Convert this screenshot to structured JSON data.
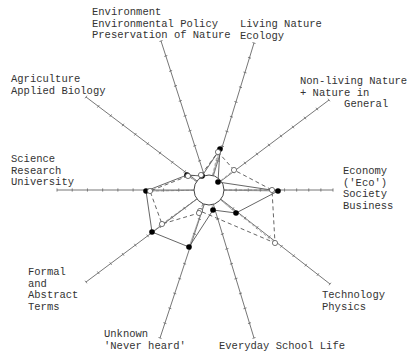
{
  "chart_data": {
    "type": "radar",
    "title": "",
    "center": [
      209,
      190
    ],
    "inner_radius": 15,
    "axes": [
      {
        "id": "environment",
        "label": [
          "Environment",
          "Environmental Policy",
          "Preservation of Nature"
        ],
        "end": [
          161,
          41
        ],
        "ticks": 9
      },
      {
        "id": "living_nature",
        "label": [
          "Living Nature",
          "Ecology"
        ],
        "end": [
          254,
          43
        ],
        "ticks": 9
      },
      {
        "id": "non_living_nature",
        "label": [
          "Non-living Nature",
          "+ Nature in",
          "      General"
        ],
        "end": [
          329,
          100
        ],
        "ticks": 9
      },
      {
        "id": "economy",
        "label": [
          "Economy",
          "('Eco')",
          "Society",
          "Business"
        ],
        "end": [
          333,
          190
        ],
        "ticks": 9
      },
      {
        "id": "technology",
        "label": [
          "Technology",
          "Physics"
        ],
        "end": [
          330,
          284
        ],
        "ticks": 9
      },
      {
        "id": "everyday_school_life",
        "label": [
          "Everyday School Life"
        ],
        "end": [
          254,
          338
        ],
        "ticks": 9
      },
      {
        "id": "unknown",
        "label": [
          "Unknown",
          "'Never heard'"
        ],
        "end": [
          160,
          338
        ],
        "ticks": 9
      },
      {
        "id": "formal_abstract",
        "label": [
          "Formal",
          "and",
          "Abstract",
          "Terms"
        ],
        "end": [
          86,
          282
        ],
        "ticks": 9
      },
      {
        "id": "science_research",
        "label": [
          "Science",
          "Research",
          "University"
        ],
        "end": [
          57,
          190
        ],
        "ticks": 9
      },
      {
        "id": "agriculture",
        "label": [
          "Agriculture",
          "Applied Biology"
        ],
        "end": [
          86,
          97
        ],
        "ticks": 9
      }
    ],
    "series": [
      {
        "name": "Series A (solid line, filled markers)",
        "style": "solid",
        "marker": "filled",
        "points": [
          [
            202,
            176
          ],
          [
            220,
            149
          ],
          [
            218,
            182
          ],
          [
            278,
            191
          ],
          [
            236,
            213
          ],
          [
            213,
            210
          ],
          [
            189,
            247
          ],
          [
            152,
            232
          ],
          [
            146,
            191
          ],
          [
            187,
            175
          ]
        ]
      },
      {
        "name": "Series B (dashed line, open markers)",
        "style": "dashed",
        "marker": "open",
        "points": [
          [
            201,
            175
          ],
          [
            218,
            152
          ],
          [
            234,
            170
          ],
          [
            272,
            190
          ],
          [
            275,
            243
          ],
          [
            200,
            211
          ],
          [
            199,
            213
          ],
          [
            162,
            224
          ],
          [
            150,
            191
          ],
          [
            188,
            176
          ]
        ]
      }
    ],
    "xlabel": "",
    "ylabel": "",
    "grid": false,
    "legend": "none"
  },
  "labels": {
    "environment": "Environment\nEnvironmental Policy\nPreservation of Nature",
    "living_nature": "Living Nature\nEcology",
    "non_living_nature": "Non-living Nature\n+ Nature in\n       General",
    "economy": "Economy\n('Eco')\nSociety\nBusiness",
    "technology": "Technology\nPhysics",
    "everyday_school_life": "Everyday School Life",
    "unknown": "Unknown\n'Never heard'",
    "formal_abstract": "Formal\nand\nAbstract\nTerms",
    "science_research": "Science\nResearch\nUniversity",
    "agriculture": "Agriculture\nApplied Biology"
  }
}
